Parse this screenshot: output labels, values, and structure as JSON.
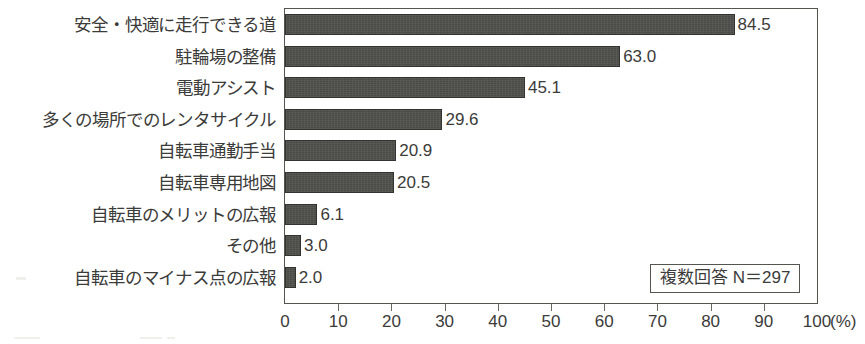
{
  "chart_data": {
    "type": "bar",
    "orientation": "horizontal",
    "title": "",
    "xlabel": "(%)",
    "ylabel": "",
    "xlim": [
      0,
      100
    ],
    "xticks": [
      0,
      10,
      20,
      30,
      40,
      50,
      60,
      70,
      80,
      90,
      100
    ],
    "xtick_labels": [
      "0",
      "10",
      "20",
      "30",
      "40",
      "50",
      "60",
      "70",
      "80",
      "90",
      "100"
    ],
    "grid": false,
    "legend": "none",
    "bar_color": "#4a4a47",
    "categories": [
      "安全・快適に走行できる道",
      "駐輪場の整備",
      "電動アシスト",
      "多くの場所でのレンタサイクル",
      "自転車通勤手当",
      "自転車専用地図",
      "自転車のメリットの広報",
      "その他",
      "自転車のマイナス点の広報"
    ],
    "values": [
      84.5,
      63.0,
      45.1,
      29.6,
      20.9,
      20.5,
      6.1,
      3.0,
      2.0
    ],
    "value_labels": [
      "84.5",
      "63.0",
      "45.1",
      "29.6",
      "20.9",
      "20.5",
      "6.1",
      "3.0",
      "2.0"
    ],
    "annotations": [
      "複数回答 N＝297"
    ]
  },
  "axis": {
    "unit_label": "(%)"
  },
  "note": {
    "text": "複数回答 N＝297"
  }
}
